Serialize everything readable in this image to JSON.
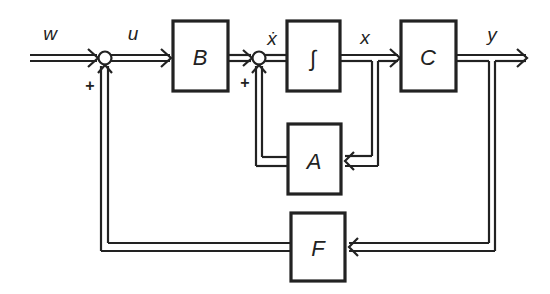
{
  "diagram": {
    "type": "state-space block diagram with output feedback",
    "colors": {
      "stroke": "#222222",
      "background": "#ffffff"
    },
    "blocks": [
      {
        "id": "B",
        "label": "B"
      },
      {
        "id": "integrator",
        "label": "∫"
      },
      {
        "id": "C",
        "label": "C"
      },
      {
        "id": "A",
        "label": "A"
      },
      {
        "id": "F",
        "label": "F"
      }
    ],
    "signals": {
      "w": "w",
      "u": "u",
      "xdot": "ẋ",
      "x": "x",
      "y": "y"
    },
    "summing_junctions": [
      {
        "id": "sum1",
        "inputs": [
          "w",
          "F output"
        ],
        "sign_label": "+"
      },
      {
        "id": "sum2",
        "inputs": [
          "B output",
          "A output"
        ],
        "sign_label": "+"
      }
    ],
    "connections": [
      "w → sum1",
      "sum1 → u → B",
      "B → sum2",
      "sum2 → ẋ → ∫",
      "∫ → x → C",
      "C → y → output",
      "x → A → sum2",
      "y → F → sum1"
    ]
  }
}
